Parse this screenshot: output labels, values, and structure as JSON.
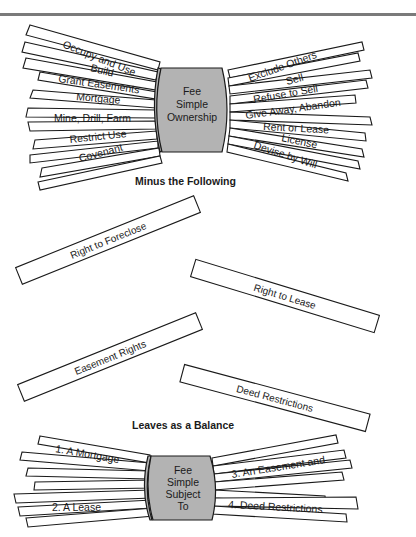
{
  "top_bundle": {
    "center_label": [
      "Fee",
      "Simple",
      "Ownership"
    ],
    "left_rights": [
      "Occupy and Use",
      "Build",
      "Grant Easements",
      "Mortgage",
      "Mine, Drill, Farm",
      "Restrict Use",
      "Covenant"
    ],
    "right_rights": [
      "Exclude Others",
      "Sell",
      "Refuse to Sell",
      "Give Away, Abandon",
      "Rent or Lease",
      "License",
      "Devise by Will"
    ]
  },
  "minus_heading": "Minus the Following",
  "removed_rights": [
    "Right to Foreclose",
    "Right to Lease",
    "Easement Rights",
    "Deed Restrictions"
  ],
  "balance_heading": "Leaves as a Balance",
  "bottom_bundle": {
    "center_label": [
      "Fee",
      "Simple",
      "Subject",
      "To"
    ],
    "left_items": [
      "1. A Mortgage",
      "2. A Lease"
    ],
    "right_items": [
      "3. An Easement and",
      "4. Deed Restrictions"
    ]
  },
  "colors": {
    "band_fill": "#b3b3b3",
    "rule": "#7a7a7a",
    "ink": "#1a1a1a"
  }
}
